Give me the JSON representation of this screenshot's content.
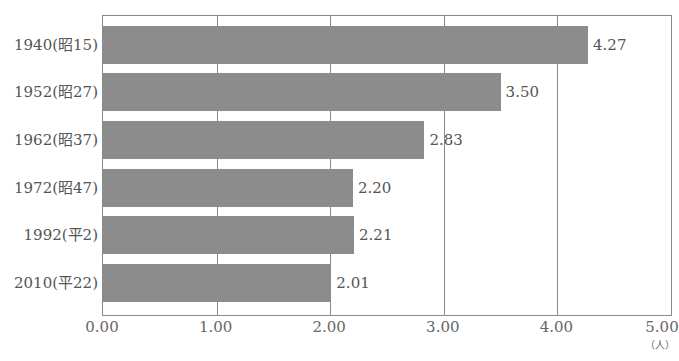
{
  "chart_data": {
    "type": "bar",
    "orientation": "horizontal",
    "title": "",
    "xlabel": "",
    "ylabel": "",
    "unit_label": "（人）",
    "categories": [
      "1940(昭15)",
      "1952(昭27)",
      "1962(昭37)",
      "1972(昭47)",
      "1992(平2)",
      "2010(平22)"
    ],
    "values": [
      4.27,
      3.5,
      2.83,
      2.2,
      2.21,
      2.01
    ],
    "value_labels": [
      "4.27",
      "3.50",
      "2.83",
      "2.20",
      "2.21",
      "2.01"
    ],
    "xlim": [
      0,
      5
    ],
    "x_ticks": [
      "0.00",
      "1.00",
      "2.00",
      "3.00",
      "4.00",
      "5.00"
    ],
    "grid": "vertical",
    "legend": "none",
    "bar_color": "#8c8c8c"
  }
}
